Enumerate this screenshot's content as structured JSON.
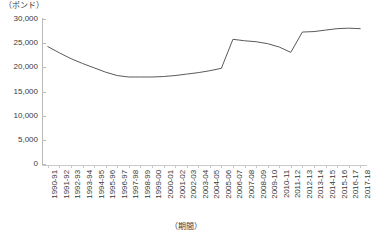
{
  "unit_label": "（ポンド）",
  "x_axis_title": "（期間）",
  "y_axis": {
    "ticks": [
      "30,000",
      "25,000",
      "20,000",
      "15,000",
      "10,000",
      "5,000",
      "0"
    ],
    "min": 0,
    "max": 30000,
    "step": 5000
  },
  "chart_data": {
    "type": "line",
    "title": "",
    "subtitle": "",
    "xlabel": "（期間）",
    "ylabel": "（ポンド）",
    "ylim": [
      0,
      30000
    ],
    "ytick_step": 5000,
    "grid": false,
    "legend": "none",
    "line_color": "#5a5a5a",
    "categories": [
      "1990-91",
      "1991-92",
      "1992-93",
      "1993-94",
      "1994-95",
      "1995-96",
      "1996-97",
      "1997-98",
      "1998-99",
      "1999-00",
      "2000-01",
      "2001-02",
      "2002-03",
      "2003-04",
      "2004-05",
      "2005-06",
      "2006-07",
      "2007-08",
      "2008-09",
      "2009-10",
      "2010-11",
      "2011-12",
      "2012-13",
      "2013-14",
      "2014-15",
      "2015-16",
      "2016-17",
      "2017-18"
    ],
    "values": [
      24300,
      23000,
      21800,
      20800,
      19900,
      19000,
      18300,
      18000,
      18000,
      18000,
      18100,
      18300,
      18600,
      18900,
      19300,
      19800,
      25800,
      25500,
      25300,
      24900,
      24200,
      23100,
      27300,
      27400,
      27700,
      28000,
      28100,
      28000
    ]
  }
}
